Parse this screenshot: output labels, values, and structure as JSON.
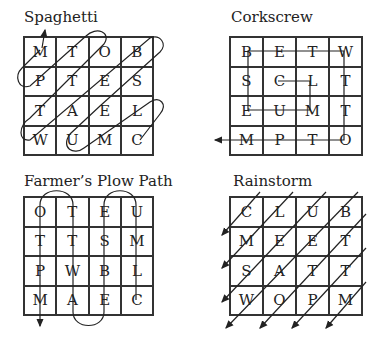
{
  "puzzles": [
    {
      "id": "spaghetti",
      "title": "Spaghetti",
      "rows": [
        [
          "M",
          "T",
          "O",
          "B"
        ],
        [
          "P",
          "T",
          "E",
          "S"
        ],
        [
          "T",
          "A",
          "E",
          "L"
        ],
        [
          "W",
          "U",
          "M",
          "C"
        ]
      ],
      "path": "diagonal loops starting at bottom-left cell toward top-left, exiting at M (arrow up)"
    },
    {
      "id": "corkscrew",
      "title": "Corkscrew",
      "rows": [
        [
          "B",
          "E",
          "T",
          "W"
        ],
        [
          "S",
          "C",
          "L",
          "T"
        ],
        [
          "E",
          "U",
          "M",
          "T"
        ],
        [
          "M",
          "P",
          "T",
          "O"
        ]
      ],
      "path": "inward spiral from C to L to M to U to E to S to B across top to W, down to O, then left along bottom row exiting with arrow left"
    },
    {
      "id": "farmers-plow-path",
      "title": "Farmer’s Plow Path",
      "rows": [
        [
          "O",
          "T",
          "E",
          "U"
        ],
        [
          "T",
          "T",
          "S",
          "M"
        ],
        [
          "P",
          "W",
          "B",
          "L"
        ],
        [
          "M",
          "A",
          "E",
          "C"
        ]
      ],
      "path": "boustrophedon columns starting at C up column 4, looping to column 3 down, column 2 up, column 1 down, exiting with arrow down"
    },
    {
      "id": "rainstorm",
      "title": "Rainstorm",
      "rows": [
        [
          "C",
          "L",
          "U",
          "B"
        ],
        [
          "M",
          "E",
          "E",
          "T"
        ],
        [
          "S",
          "A",
          "T",
          "T"
        ],
        [
          "W",
          "O",
          "P",
          "M"
        ]
      ],
      "path": "parallel diagonal arrows running from upper-right to lower-left through every diagonal"
    }
  ]
}
